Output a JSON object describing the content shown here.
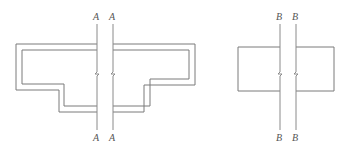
{
  "figure": {
    "left_section": {
      "label_top_1": "A",
      "label_top_2": "A",
      "label_bottom_1": "A",
      "label_bottom_2": "A"
    },
    "right_section": {
      "label_top_1": "B",
      "label_top_2": "B",
      "label_bottom_1": "B",
      "label_bottom_2": "B"
    },
    "line_color": "#777777"
  }
}
